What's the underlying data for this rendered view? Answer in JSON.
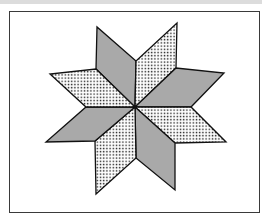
{
  "diagram": {
    "title": "",
    "colors": {
      "solid_fill": "#a9a9a9",
      "dot_color": "#1a1a1a",
      "background": "#ffffff",
      "outline": "#111111",
      "frame": "#3a3a3a"
    },
    "pieces": [
      {
        "name": "diamond-top-left",
        "fill": "solid"
      },
      {
        "name": "diamond-top-right",
        "fill": "dotted"
      },
      {
        "name": "diamond-right-upper",
        "fill": "solid"
      },
      {
        "name": "diamond-right-lower",
        "fill": "dotted"
      },
      {
        "name": "diamond-bottom-right",
        "fill": "solid"
      },
      {
        "name": "diamond-bottom-left",
        "fill": "dotted"
      },
      {
        "name": "diamond-left-lower",
        "fill": "solid"
      },
      {
        "name": "diamond-left-upper",
        "fill": "dotted"
      }
    ]
  }
}
